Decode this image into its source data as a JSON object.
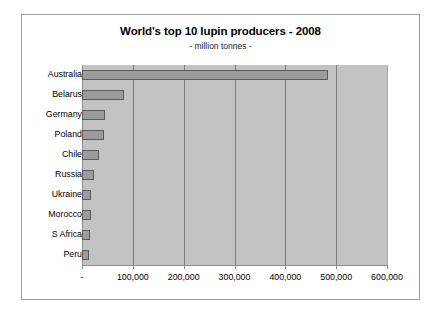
{
  "chart_data": {
    "type": "bar",
    "orientation": "horizontal",
    "title": "World's top 10 lupin producers - 2008",
    "subtitle": "- million tonnes -",
    "xlabel": "",
    "ylabel": "",
    "xlim": [
      0,
      600000
    ],
    "grid": true,
    "legend": false,
    "categories": [
      "Australia",
      "Belarus",
      "Germany",
      "Poland",
      "Chile",
      "Russia",
      "Ukraine",
      "Morocco",
      "S Africa",
      "Peru"
    ],
    "values": [
      483000,
      83000,
      46000,
      43000,
      34000,
      24000,
      18000,
      18000,
      16000,
      14000
    ],
    "xticks": [
      0,
      100000,
      200000,
      300000,
      400000,
      500000,
      600000
    ],
    "xtick_labels": [
      "-",
      "100,000",
      "200,000",
      "300,000",
      "400,000",
      "500,000",
      "600,000"
    ],
    "colors": {
      "bar_fill": "#9c9c9c",
      "bar_border": "#5a5a5a",
      "plot_background": "#c3c3c3",
      "gridline": "#7d7d7d",
      "frame_border": "#9d9d9d",
      "text": "#000000"
    }
  }
}
